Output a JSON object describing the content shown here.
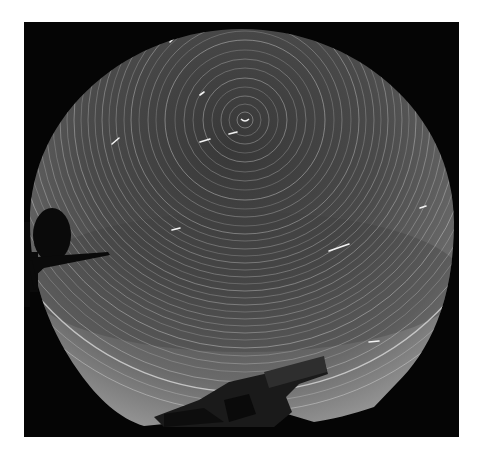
{
  "image": {
    "description": "All-sky fisheye long-exposure photograph of circumpolar star trails",
    "frame": {
      "x": 24,
      "y": 22,
      "width": 435,
      "height": 415,
      "background": "#050505"
    },
    "sky": {
      "center_x": 218,
      "center_y": 215,
      "radius_x": 214,
      "radius_y": 200,
      "inner_color": "#3c3c3c",
      "mid_color": "#4d4d4d",
      "outer_color": "#8e8e8e"
    },
    "pole": {
      "x": 221,
      "y": 98
    },
    "trail_color": "#d8d8d8",
    "trails": [
      {
        "r": 8,
        "opacity": 0.5
      },
      {
        "r": 16,
        "opacity": 0.35
      },
      {
        "r": 24,
        "opacity": 0.45
      },
      {
        "r": 33,
        "opacity": 0.3
      },
      {
        "r": 42,
        "opacity": 0.5
      },
      {
        "r": 52,
        "opacity": 0.35
      },
      {
        "r": 61,
        "opacity": 0.4
      },
      {
        "r": 70,
        "opacity": 0.3
      },
      {
        "r": 80,
        "opacity": 0.55
      },
      {
        "r": 89,
        "opacity": 0.3
      },
      {
        "r": 97,
        "opacity": 0.4
      },
      {
        "r": 106,
        "opacity": 0.3
      },
      {
        "r": 114,
        "opacity": 0.5
      },
      {
        "r": 121,
        "opacity": 0.35
      },
      {
        "r": 129,
        "opacity": 0.4
      },
      {
        "r": 136,
        "opacity": 0.3
      },
      {
        "r": 143,
        "opacity": 0.45
      },
      {
        "r": 150,
        "opacity": 0.35
      },
      {
        "r": 157,
        "opacity": 0.4
      },
      {
        "r": 164,
        "opacity": 0.3
      },
      {
        "r": 171,
        "opacity": 0.5
      },
      {
        "r": 178,
        "opacity": 0.35
      },
      {
        "r": 185,
        "opacity": 0.45
      },
      {
        "r": 192,
        "opacity": 0.3
      },
      {
        "r": 199,
        "opacity": 0.4
      },
      {
        "r": 206,
        "opacity": 0.35
      },
      {
        "r": 213,
        "opacity": 0.45
      },
      {
        "r": 220,
        "opacity": 0.3
      },
      {
        "r": 228,
        "opacity": 0.55
      },
      {
        "r": 236,
        "opacity": 0.35
      },
      {
        "r": 244,
        "opacity": 0.4
      },
      {
        "r": 252,
        "opacity": 0.3
      },
      {
        "r": 262,
        "opacity": 0.5
      },
      {
        "r": 272,
        "opacity": 0.8
      },
      {
        "r": 282,
        "opacity": 0.4
      },
      {
        "r": 292,
        "opacity": 0.6
      }
    ],
    "streaks": [
      {
        "x1": 88,
        "y1": 122,
        "x2": 95,
        "y2": 116
      },
      {
        "x1": 176,
        "y1": 120,
        "x2": 186,
        "y2": 117
      },
      {
        "x1": 205,
        "y1": 112,
        "x2": 213,
        "y2": 110
      },
      {
        "x1": 146,
        "y1": 20,
        "x2": 150,
        "y2": 16
      },
      {
        "x1": 176,
        "y1": 73,
        "x2": 180,
        "y2": 70
      },
      {
        "x1": 396,
        "y1": 186,
        "x2": 402,
        "y2": 184
      },
      {
        "x1": 345,
        "y1": 320,
        "x2": 355,
        "y2": 319
      },
      {
        "x1": 148,
        "y1": 208,
        "x2": 156,
        "y2": 206
      },
      {
        "x1": 305,
        "y1": 229,
        "x2": 325,
        "y2": 222
      }
    ],
    "foreground": {
      "antenna_dish": "left edge, elliptical silhouette",
      "horizon_structures": "bottom center dark silhouettes"
    }
  }
}
